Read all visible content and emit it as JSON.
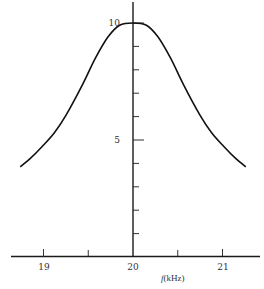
{
  "chart_data": {
    "type": "line",
    "title": "",
    "xlabel": "f(kHz)",
    "xlabel_parts": {
      "symbol": "f",
      "unit": "(kHz)"
    },
    "ylabel": "",
    "xlim": [
      18.74,
      21.4
    ],
    "ylim": [
      0,
      10.9
    ],
    "grid": false,
    "legend": null,
    "x_ticks": [
      19,
      19.5,
      20,
      20.5,
      21
    ],
    "x_tick_labels": [
      "19",
      "",
      "20",
      "",
      "21"
    ],
    "y_ticks": [
      1,
      2,
      3,
      4,
      5,
      6,
      7,
      8,
      9,
      10
    ],
    "y_tick_labels": [
      "",
      "",
      "",
      "",
      "5",
      "",
      "",
      "",
      "",
      "10"
    ],
    "y_axis_position_x": 20,
    "series": [
      {
        "name": "response",
        "x": [
          18.74,
          18.85,
          18.98,
          19.12,
          19.25,
          19.44,
          19.58,
          19.72,
          19.85,
          20.0,
          20.15,
          20.28,
          20.42,
          20.56,
          20.75,
          20.88,
          21.02,
          21.15,
          21.26
        ],
        "y": [
          3.85,
          4.2,
          4.7,
          5.3,
          6.05,
          7.4,
          8.5,
          9.4,
          9.9,
          10.0,
          9.9,
          9.4,
          8.5,
          7.4,
          6.05,
          5.3,
          4.7,
          4.2,
          3.85
        ]
      }
    ]
  },
  "labels": {
    "y_top": "10",
    "y_mid": "5",
    "x_19": "19",
    "x_20": "20",
    "x_21": "21",
    "x_axis_symbol": "f",
    "x_axis_unit": "(kHz)"
  }
}
